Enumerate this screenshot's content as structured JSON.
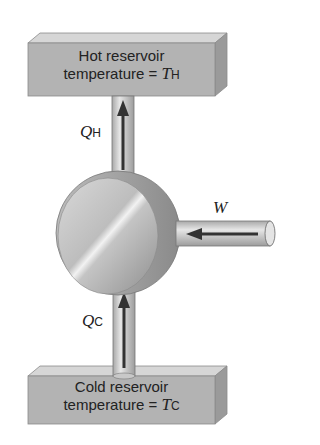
{
  "hot_reservoir": {
    "line1": "Hot reservoir",
    "line2": "temperature = ",
    "symbol": "T",
    "subscript": "H"
  },
  "cold_reservoir": {
    "line1": "Cold reservoir",
    "line2": "temperature = ",
    "symbol": "T",
    "subscript": "C"
  },
  "heat_hot": {
    "symbol": "Q",
    "subscript": "H"
  },
  "heat_cold": {
    "symbol": "Q",
    "subscript": "C"
  },
  "work": {
    "symbol": "W"
  },
  "colors": {
    "box_front": "#b3b3b3",
    "box_top": "#d6d6d6",
    "box_side": "#9a9a9a",
    "pipe": "#cfcfcf",
    "arrow": "#333333"
  }
}
